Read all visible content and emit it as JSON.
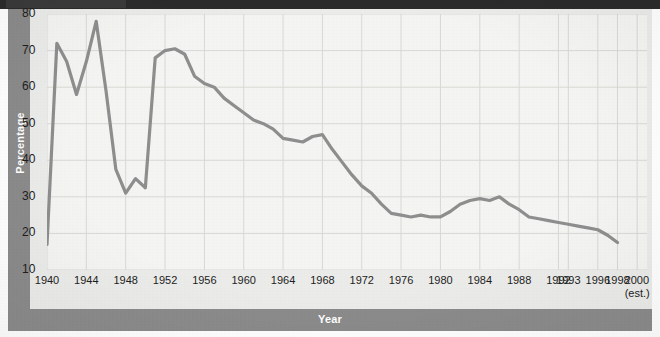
{
  "figure": {
    "y_axis_title": "Percentage",
    "x_axis_title": "Year"
  },
  "chart_data": {
    "type": "line",
    "title": "",
    "xlabel": "Year",
    "ylabel": "Percentage",
    "xlim": [
      1940,
      2001
    ],
    "ylim": [
      10,
      80
    ],
    "grid": true,
    "legend": false,
    "line_color": "#8e8e8e",
    "x_tick_labels": [
      "1940",
      "1944",
      "1948",
      "1952",
      "1956",
      "1960",
      "1964",
      "1968",
      "1972",
      "1976",
      "1980",
      "1984",
      "1988",
      "1992",
      "1993",
      "1996",
      "1998",
      "2000"
    ],
    "x_tick_sub_labels": [
      "",
      "",
      "",
      "",
      "",
      "",
      "",
      "",
      "",
      "",
      "",
      "",
      "",
      "",
      "",
      "",
      "",
      "(est.)"
    ],
    "x_tick_values": [
      1940,
      1944,
      1948,
      1952,
      1956,
      1960,
      1964,
      1968,
      1972,
      1976,
      1980,
      1984,
      1988,
      1992,
      1993,
      1996,
      1998,
      2000
    ],
    "y_tick_labels": [
      "80",
      "70",
      "60",
      "50",
      "40",
      "30",
      "20",
      "10"
    ],
    "y_tick_values": [
      80,
      70,
      60,
      50,
      40,
      30,
      20,
      10
    ],
    "x": [
      1940,
      1941,
      1942,
      1943,
      1944,
      1945,
      1946,
      1947,
      1948,
      1949,
      1950,
      1951,
      1952,
      1953,
      1954,
      1955,
      1956,
      1957,
      1958,
      1959,
      1960,
      1961,
      1962,
      1963,
      1964,
      1965,
      1966,
      1967,
      1968,
      1969,
      1970,
      1971,
      1972,
      1973,
      1974,
      1975,
      1976,
      1977,
      1978,
      1979,
      1980,
      1981,
      1982,
      1983,
      1984,
      1985,
      1986,
      1987,
      1988,
      1989,
      1990,
      1991,
      1992,
      1993,
      1994,
      1995,
      1996,
      1997,
      1998
    ],
    "values": [
      17,
      72,
      67,
      58,
      67,
      78,
      59,
      37.5,
      31,
      35,
      32.5,
      68,
      70,
      70.5,
      69,
      63,
      61,
      60,
      57,
      55,
      53,
      51,
      50,
      48.5,
      46,
      45.5,
      45,
      46.5,
      47,
      43,
      39.5,
      36,
      33,
      31,
      28,
      25.5,
      25,
      24.5,
      25,
      24.5,
      24.5,
      26,
      28,
      29,
      29.5,
      29,
      30,
      28,
      26.5,
      24.5,
      24,
      23.5,
      23,
      22.5,
      22,
      21.5,
      21,
      19.5,
      17.5
    ],
    "value_units": "percent"
  }
}
